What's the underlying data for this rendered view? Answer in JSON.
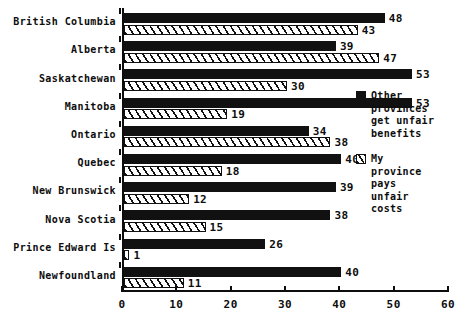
{
  "chart_data": {
    "type": "bar",
    "orientation": "horizontal",
    "title": "",
    "xlabel": "",
    "ylabel": "",
    "xlim": [
      0,
      60
    ],
    "xticks": [
      0,
      10,
      20,
      30,
      40,
      50,
      60
    ],
    "grid": false,
    "legend_position": "right",
    "categories": [
      "British Columbia",
      "Alberta",
      "Saskatchewan",
      "Manitoba",
      "Ontario",
      "Quebec",
      "New Brunswick",
      "Nova Scotia",
      "Prince Edward Is",
      "Newfoundland"
    ],
    "series": [
      {
        "name": "Other provinces get unfair benefits",
        "pattern": "solid",
        "values": [
          48,
          39,
          53,
          53,
          34,
          40,
          39,
          38,
          26,
          40
        ]
      },
      {
        "name": "My province pays unfair costs",
        "pattern": "hatched",
        "values": [
          43,
          47,
          30,
          19,
          38,
          18,
          12,
          15,
          1,
          11
        ]
      }
    ]
  },
  "legend": {
    "entries": [
      {
        "swatch": "solid-swatch",
        "label": "Other\nprovinces\nget unfair\nbenefits"
      },
      {
        "swatch": "hatched-swatch",
        "label": "My\nprovince\npays\nunfair\ncosts"
      }
    ]
  }
}
